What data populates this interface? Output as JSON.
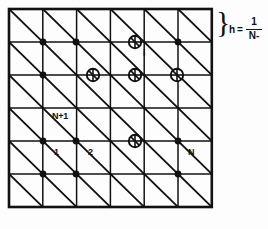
{
  "figure": {
    "colors": {
      "line": "#111111",
      "background": "#fdfdfd",
      "node_fill": "#111111",
      "circle_stroke": "#111111"
    }
  },
  "mesh": {
    "columns": 6,
    "rows": 6,
    "bounds": {
      "x0": 9,
      "y0": 9,
      "x1": 212,
      "y1": 207
    },
    "cell_width": 33.8,
    "cell_height": 33.0,
    "diagonal_direction": "top-left-to-bottom-right",
    "outer_border_width": 2.4,
    "inner_line_width": 1.4,
    "diagonal_line_width": 1.8
  },
  "nodes": {
    "filled": [
      {
        "x": 43,
        "y": 42
      },
      {
        "x": 76,
        "y": 42
      },
      {
        "x": 178,
        "y": 42
      },
      {
        "x": 43,
        "y": 75
      },
      {
        "x": 43,
        "y": 141
      },
      {
        "x": 76,
        "y": 141
      },
      {
        "x": 178,
        "y": 141
      },
      {
        "x": 43,
        "y": 174
      },
      {
        "x": 76,
        "y": 174
      },
      {
        "x": 178,
        "y": 174
      }
    ],
    "circled": [
      {
        "x": 135,
        "y": 42
      },
      {
        "x": 93,
        "y": 75
      },
      {
        "x": 135,
        "y": 75
      },
      {
        "x": 177,
        "y": 75
      },
      {
        "x": 135,
        "y": 141
      }
    ],
    "circle_radius": 6.2,
    "dot_radius": 3.4
  },
  "labels": {
    "i": {
      "text": "i",
      "x": 143,
      "y": 56
    },
    "n_plus_one": {
      "text": "N+1",
      "x": 53,
      "y": 118
    },
    "one": {
      "text": "1",
      "x": 55,
      "y": 155
    },
    "two": {
      "text": "2",
      "x": 89,
      "y": 155
    },
    "cap_n": {
      "text": "N",
      "x": 189,
      "y": 155
    }
  },
  "annotation": {
    "brace": "}",
    "formula": {
      "lhs": "h",
      "equals": "=",
      "numerator": "1",
      "denominator": "N-"
    }
  }
}
